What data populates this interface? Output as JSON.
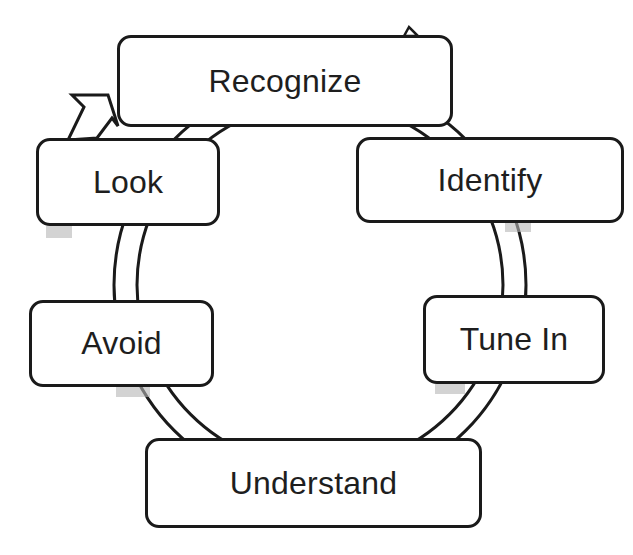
{
  "diagram": {
    "type": "cycle",
    "direction": "clockwise",
    "colors": {
      "stroke": "#1a1a1a",
      "fill": "#ffffff",
      "text": "#1e1e1e",
      "ring_fill": "#ffffff",
      "ring_shade": "#b5b5b5"
    },
    "nodes": [
      {
        "id": "recognize",
        "label": "Recognize"
      },
      {
        "id": "identify",
        "label": "Identify"
      },
      {
        "id": "tune-in",
        "label": "Tune In"
      },
      {
        "id": "understand",
        "label": "Understand"
      },
      {
        "id": "avoid",
        "label": "Avoid"
      },
      {
        "id": "look",
        "label": "Look"
      }
    ],
    "edges": [
      {
        "from": "recognize",
        "to": "identify"
      },
      {
        "from": "identify",
        "to": "tune-in"
      },
      {
        "from": "tune-in",
        "to": "understand"
      },
      {
        "from": "understand",
        "to": "avoid"
      },
      {
        "from": "avoid",
        "to": "look"
      },
      {
        "from": "look",
        "to": "recognize",
        "arrow": true
      }
    ]
  }
}
